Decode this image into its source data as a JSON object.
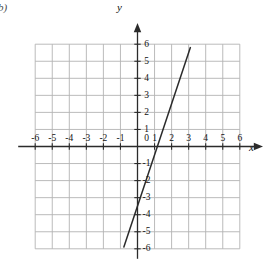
{
  "figure": {
    "part_label": "b)",
    "x_axis_name": "x",
    "y_axis_name": "y",
    "origin_label": "0"
  },
  "chart_data": {
    "type": "line",
    "title": "",
    "subtitle": "",
    "xlabel": "x",
    "ylabel": "y",
    "xlim": [
      -6,
      6
    ],
    "ylim": [
      -6,
      6
    ],
    "grid": true,
    "grid_step": 1,
    "legend": "none",
    "x_tick_labels": [
      "-6",
      "-5",
      "-4",
      "-3",
      "-2",
      "-1",
      "1",
      "2",
      "3",
      "4",
      "5",
      "6"
    ],
    "y_tick_labels": [
      "6",
      "5",
      "4",
      "3",
      "2",
      "1",
      "-1",
      "-2",
      "-3",
      "-4",
      "-5",
      "-6"
    ],
    "series": [
      {
        "name": "line",
        "slope": 3,
        "y_intercept": -3.5,
        "x_intercept": 1.17,
        "points": [
          [
            -0.8,
            -5.9
          ],
          [
            3.1,
            5.8
          ]
        ]
      }
    ],
    "annotations": []
  }
}
